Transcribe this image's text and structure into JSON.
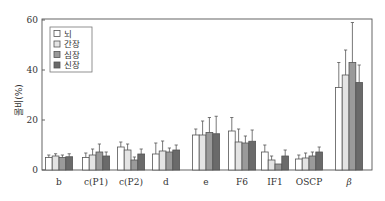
{
  "chart_data": {
    "type": "bar",
    "title": "",
    "xlabel": "",
    "ylabel": "몰비(%)",
    "ylim": [
      0,
      60
    ],
    "yticks": [
      0,
      20,
      40,
      60
    ],
    "grid": false,
    "legend_position": "upper-left",
    "categories": [
      "b",
      "c(P1)",
      "c(P2)",
      "d",
      "e",
      "F6",
      "IF1",
      "OSCP",
      "β"
    ],
    "series": [
      {
        "name": "뇌",
        "color": "#ffffff",
        "values": [
          5.0,
          5.0,
          9.2,
          6.4,
          14.0,
          15.6,
          7.2,
          4.4,
          33.0
        ],
        "errors": [
          1.0,
          1.8,
          2.0,
          4.4,
          2.4,
          5.4,
          2.8,
          1.6,
          10.0
        ]
      },
      {
        "name": "간장",
        "color": "#e4e4e4",
        "values": [
          5.6,
          6.0,
          8.0,
          7.6,
          14.0,
          11.2,
          4.0,
          4.8,
          38.0
        ],
        "errors": [
          0.9,
          2.4,
          2.4,
          4.0,
          5.6,
          5.2,
          1.6,
          2.0,
          10.0
        ]
      },
      {
        "name": "심장",
        "color": "#9a9a9a",
        "values": [
          5.0,
          7.2,
          4.0,
          7.2,
          15.0,
          10.8,
          2.4,
          5.6,
          43.0
        ],
        "errors": [
          1.0,
          3.2,
          1.2,
          1.6,
          6.0,
          2.8,
          0.0,
          1.6,
          16.0
        ]
      },
      {
        "name": "신장",
        "color": "#6a6a6a",
        "values": [
          5.3,
          5.6,
          6.4,
          8.0,
          14.5,
          11.5,
          5.6,
          7.2,
          35.0
        ],
        "errors": [
          1.2,
          1.6,
          2.0,
          2.0,
          7.0,
          4.5,
          2.4,
          2.0,
          7.0
        ]
      }
    ]
  },
  "axis": {
    "ylabel": "몰비(%)",
    "yticks": [
      "0",
      "20",
      "40",
      "60"
    ]
  },
  "legend": {
    "items": [
      "뇌",
      "간장",
      "심장",
      "신장"
    ]
  }
}
